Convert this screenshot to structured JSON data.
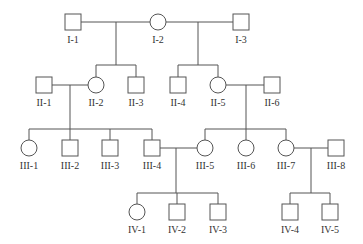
{
  "diagram": {
    "type": "pedigree",
    "colors": {
      "stroke": "#555555",
      "text": "#333333",
      "background": "#ffffff"
    },
    "individuals": [
      {
        "id": "I-1",
        "label": "I-1",
        "sex": "male",
        "x": 73,
        "y": 22
      },
      {
        "id": "I-2",
        "label": "I-2",
        "sex": "female",
        "x": 158,
        "y": 22
      },
      {
        "id": "I-3",
        "label": "I-3",
        "sex": "male",
        "x": 241,
        "y": 22
      },
      {
        "id": "II-1",
        "label": "II-1",
        "sex": "male",
        "x": 44,
        "y": 85
      },
      {
        "id": "II-2",
        "label": "II-2",
        "sex": "female",
        "x": 96,
        "y": 85
      },
      {
        "id": "II-3",
        "label": "II-3",
        "sex": "male",
        "x": 136,
        "y": 85
      },
      {
        "id": "II-4",
        "label": "II-4",
        "sex": "male",
        "x": 178,
        "y": 85
      },
      {
        "id": "II-5",
        "label": "II-5",
        "sex": "female",
        "x": 218,
        "y": 85
      },
      {
        "id": "II-6",
        "label": "II-6",
        "sex": "male",
        "x": 272,
        "y": 85
      },
      {
        "id": "III-1",
        "label": "III-1",
        "sex": "female",
        "x": 29,
        "y": 148
      },
      {
        "id": "III-2",
        "label": "III-2",
        "sex": "male",
        "x": 70,
        "y": 148
      },
      {
        "id": "III-3",
        "label": "III-3",
        "sex": "male",
        "x": 110,
        "y": 148
      },
      {
        "id": "III-4",
        "label": "III-4",
        "sex": "male",
        "x": 152,
        "y": 148
      },
      {
        "id": "III-5",
        "label": "III-5",
        "sex": "female",
        "x": 205,
        "y": 148
      },
      {
        "id": "III-6",
        "label": "III-6",
        "sex": "female",
        "x": 246,
        "y": 148
      },
      {
        "id": "III-7",
        "label": "III-7",
        "sex": "female",
        "x": 286,
        "y": 148
      },
      {
        "id": "III-8",
        "label": "III-8",
        "sex": "male",
        "x": 336,
        "y": 148
      },
      {
        "id": "IV-1",
        "label": "IV-1",
        "sex": "female",
        "x": 137,
        "y": 212
      },
      {
        "id": "IV-2",
        "label": "IV-2",
        "sex": "male",
        "x": 177,
        "y": 212
      },
      {
        "id": "IV-3",
        "label": "IV-3",
        "sex": "male",
        "x": 218,
        "y": 212
      },
      {
        "id": "IV-4",
        "label": "IV-4",
        "sex": "male",
        "x": 290,
        "y": 212
      },
      {
        "id": "IV-5",
        "label": "IV-5",
        "sex": "male",
        "x": 330,
        "y": 212
      }
    ],
    "couples": [
      {
        "partners": [
          "I-1",
          "I-2"
        ],
        "y": 22,
        "x1": 81,
        "x2": 150,
        "drop_x": 116,
        "children": [
          "II-2",
          "II-3"
        ],
        "sib_y": 65
      },
      {
        "partners": [
          "I-2",
          "I-3"
        ],
        "y": 22,
        "x1": 166,
        "x2": 233,
        "drop_x": 198,
        "children": [
          "II-4",
          "II-5"
        ],
        "sib_y": 65
      },
      {
        "partners": [
          "II-1",
          "II-2"
        ],
        "y": 85,
        "x1": 52,
        "x2": 88,
        "drop_x": 70,
        "children": [
          "III-1",
          "III-2",
          "III-3",
          "III-4"
        ],
        "sib_y": 129
      },
      {
        "partners": [
          "II-5",
          "II-6"
        ],
        "y": 85,
        "x1": 226,
        "x2": 264,
        "drop_x": 246,
        "children": [
          "III-5",
          "III-6",
          "III-7"
        ],
        "sib_y": 129
      },
      {
        "partners": [
          "III-4",
          "III-5"
        ],
        "y": 148,
        "x1": 160,
        "x2": 197,
        "drop_x": 176,
        "children": [
          "IV-1",
          "IV-2",
          "IV-3"
        ],
        "sib_y": 193
      },
      {
        "partners": [
          "III-7",
          "III-8"
        ],
        "y": 148,
        "x1": 294,
        "x2": 328,
        "drop_x": 311,
        "children": [
          "IV-4",
          "IV-5"
        ],
        "sib_y": 193
      }
    ]
  }
}
